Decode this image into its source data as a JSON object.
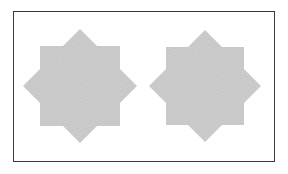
{
  "figure": {
    "frame": {
      "border_color": "#3a3a3a",
      "background": "#ffffff"
    },
    "shapes": [
      {
        "type": "eight-pointed-star",
        "center": [
          80,
          86
        ],
        "square_half": 40,
        "tip_radius": 57,
        "fill": "#c8c8c8"
      },
      {
        "type": "eight-pointed-star",
        "center": [
          205,
          86
        ],
        "square_half": 39,
        "tip_radius": 56,
        "fill": "#c8c8c8"
      }
    ]
  }
}
